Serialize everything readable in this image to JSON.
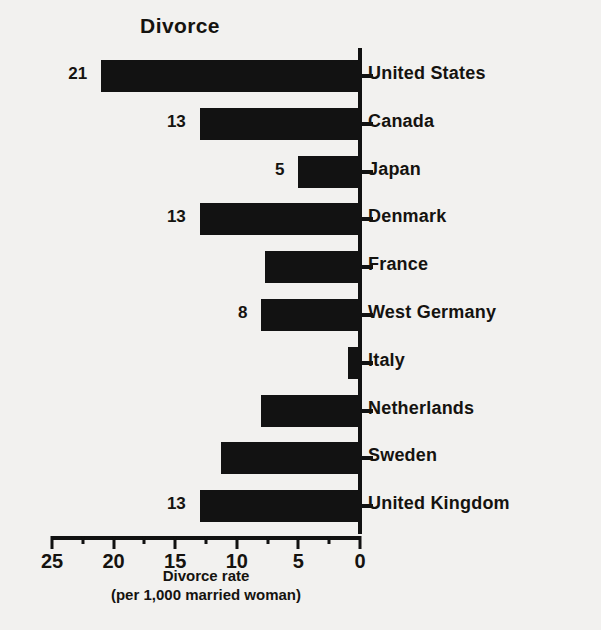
{
  "chart_data": {
    "type": "bar",
    "orientation": "horizontal",
    "title": "Divorce",
    "xlabel": "Divorce rate",
    "xlabel_sub": "(per 1,000 married woman)",
    "ylabel": "",
    "xlim": [
      25,
      0
    ],
    "x_axis_reversed": true,
    "grid": false,
    "legend": null,
    "tick_labels": [
      "25",
      "20",
      "15",
      "10",
      "5",
      "0"
    ],
    "tick_values": [
      25,
      20,
      15,
      10,
      5,
      0
    ],
    "minor_tick_values": [
      22.5,
      17.5,
      12.5,
      7.5,
      2.5
    ],
    "bar_color": "#121212",
    "categories": [
      "United States",
      "Canada",
      "Japan",
      "Denmark",
      "France",
      "West Germany",
      "Italy",
      "Netherlands",
      "Sweden",
      "United Kingdom"
    ],
    "values": [
      21,
      13,
      5,
      13,
      7.7,
      8,
      1,
      8,
      11.3,
      13
    ],
    "data_labels": [
      "21",
      "13",
      "5",
      "13",
      "",
      "8",
      "",
      "",
      "",
      "13"
    ]
  }
}
